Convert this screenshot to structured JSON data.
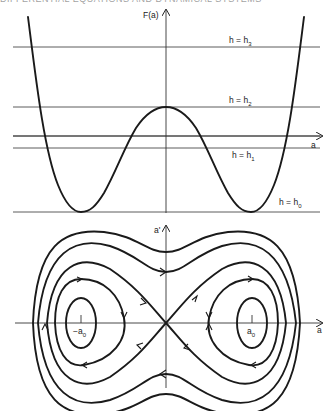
{
  "page_header": "DIFFERENTIAL EQUATIONS AND DYNAMICAL SYSTEMS",
  "top_panel": {
    "y_axis_label": "F(a)",
    "x_axis_label": "a",
    "levels": [
      {
        "id": "h3",
        "label_main": "h = h",
        "label_sub": "3"
      },
      {
        "id": "h2",
        "label_main": "h = h",
        "label_sub": "2"
      },
      {
        "id": "h1",
        "label_main": "h = h",
        "label_sub": "1"
      },
      {
        "id": "h0",
        "label_main": "h = h",
        "label_sub": "0"
      }
    ]
  },
  "bottom_panel": {
    "y_axis_label": "a'",
    "x_axis_label": "a",
    "left_equilibrium_label": "−a",
    "left_equilibrium_sub": "0",
    "right_equilibrium_label": "a",
    "right_equilibrium_sub": "0"
  },
  "colors": {
    "ink": "#1a1a1a",
    "background": "#ffffff"
  }
}
